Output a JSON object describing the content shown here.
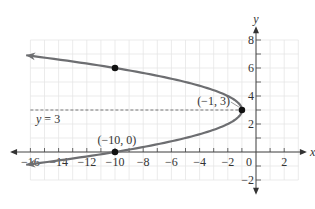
{
  "chart_data": {
    "type": "line",
    "title": "",
    "xlabel": "x",
    "ylabel": "y",
    "xlim": [
      -16,
      3
    ],
    "ylim": [
      -2,
      8
    ],
    "grid": true,
    "x_ticks": [
      -16,
      -14,
      -12,
      -10,
      -8,
      -6,
      -4,
      -2,
      0,
      2
    ],
    "x_tick_labels": [
      "−16",
      "−14",
      "−12",
      "−10",
      "−8",
      "−6",
      "−4",
      "−2",
      "0",
      "2"
    ],
    "y_ticks": [
      -2,
      2,
      4,
      6,
      8
    ],
    "y_tick_labels": [
      "−2",
      "2",
      "4",
      "6",
      "8"
    ],
    "series": [
      {
        "name": "parabola x = -(y-3)^2 - 1",
        "equation": "x = -(y - 3)^2 - 1",
        "color": "#6d6e71",
        "arrows_both_ends": true
      }
    ],
    "points": [
      {
        "x": -1,
        "y": 3,
        "label": "(−1, 3)"
      },
      {
        "x": -10,
        "y": 0,
        "label": "(−10, 0)"
      },
      {
        "x": -10,
        "y": 6,
        "label": ""
      }
    ],
    "axis_of_symmetry": {
      "y": 3,
      "label": "y = 3",
      "style": "dashed"
    }
  },
  "labels": {
    "x_axis": "x",
    "y_axis": "y",
    "vertex": "(−1, 3)",
    "x_intercept": "(−10, 0)",
    "symmetry": "y = 3"
  }
}
